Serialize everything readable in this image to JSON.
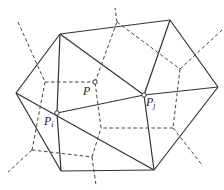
{
  "diagram": {
    "type": "delaunay-voronoi",
    "labels": {
      "p": "P",
      "pi_base": "P",
      "pi_sub": "i",
      "pj_base": "P",
      "pj_sub": "j"
    },
    "colors": {
      "delaunay_edge": "#333333",
      "voronoi_edge": "#444444",
      "background": "#ffffff"
    },
    "points": {
      "A": [
        60,
        34
      ],
      "B": [
        170,
        20
      ],
      "C": [
        218,
        87
      ],
      "D": [
        154,
        170
      ],
      "E": [
        61,
        171
      ],
      "F": [
        16,
        93
      ],
      "Pi": [
        57,
        113
      ],
      "Pj": [
        144,
        95
      ]
    },
    "voronoi_vertices": {
      "P": [
        95,
        82
      ],
      "V1": [
        45,
        82
      ],
      "V2": [
        32,
        150
      ],
      "V3": [
        92,
        157
      ],
      "V4": [
        173,
        128
      ],
      "V5": [
        180,
        69
      ],
      "V6": [
        117,
        22
      ]
    }
  }
}
